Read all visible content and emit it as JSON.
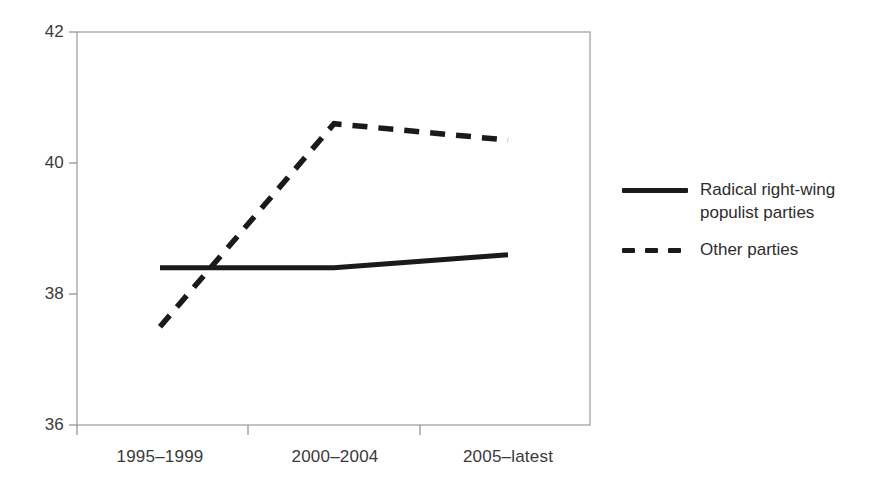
{
  "chart_data": {
    "type": "line",
    "title": "",
    "subtitle": "",
    "xlabel": "",
    "ylabel": "",
    "categories": [
      "1995–1999",
      "2000–2004",
      "2005–latest"
    ],
    "series": [
      {
        "name": "Radical right-wing populist parties",
        "style": "solid",
        "color": "#1a1a1a",
        "values": [
          38.4,
          38.4,
          38.6
        ]
      },
      {
        "name": "Other parties",
        "style": "dashed",
        "color": "#1a1a1a",
        "values": [
          37.5,
          40.6,
          40.35
        ]
      }
    ],
    "ylim": [
      36,
      42
    ],
    "yticks": [
      36,
      38,
      40,
      42
    ],
    "ytick_labels": [
      "36",
      "38",
      "40",
      "42"
    ],
    "grid": false,
    "legend_position": "right"
  },
  "legend": {
    "entries": [
      {
        "label_line1": "Radical right-wing",
        "label_line2": "populist parties",
        "swatch": "solid-line-swatch"
      },
      {
        "label_line1": "Other parties",
        "label_line2": "",
        "swatch": "dashed-line-swatch"
      }
    ]
  },
  "axes": {
    "y_tick_0": "42",
    "y_tick_1": "40",
    "y_tick_2": "38",
    "y_tick_3": "36",
    "x_tick_0": "1995–1999",
    "x_tick_1": "2000–2004",
    "x_tick_2": "2005–latest"
  },
  "colors": {
    "background": "#ffffff",
    "axis": "#808080",
    "series": "#1a1a1a",
    "text": "#2d2d2d"
  }
}
